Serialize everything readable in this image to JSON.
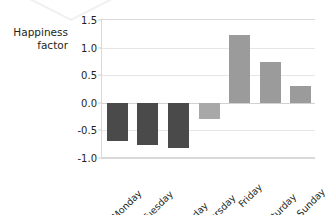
{
  "figure": {
    "decoration": "v-shaped-mark"
  },
  "chart_data": {
    "type": "bar",
    "title": "",
    "xlabel": "",
    "ylabel": "Happiness\nfactor",
    "categories": [
      "Monday",
      "Tuesday",
      "Wednesday",
      "Thursday",
      "Friday",
      "Saturday",
      "Sunday"
    ],
    "values": [
      -0.7,
      -0.76,
      -0.82,
      -0.29,
      1.23,
      0.74,
      0.31
    ],
    "ylim": [
      -1.0,
      1.5
    ],
    "yticks": [
      "1.5",
      "1.0",
      "0.5",
      "0.0",
      "-0.5",
      "-1.0"
    ],
    "ytick_values": [
      1.5,
      1.0,
      0.5,
      0.0,
      -0.5,
      -1.0
    ],
    "grid": true,
    "legend": "none",
    "bar_colors": {
      "negative_strong": "#4a4a4a",
      "negative_weak": "#a8a8a8",
      "positive": "#9b9b9b"
    },
    "bar_color_map": [
      "#4a4a4a",
      "#4a4a4a",
      "#4a4a4a",
      "#a8a8a8",
      "#9b9b9b",
      "#9b9b9b",
      "#9b9b9b"
    ],
    "axis_color": "#d9d9d9",
    "grid_color": "#e6e6e6",
    "text_color": "#231f20"
  }
}
